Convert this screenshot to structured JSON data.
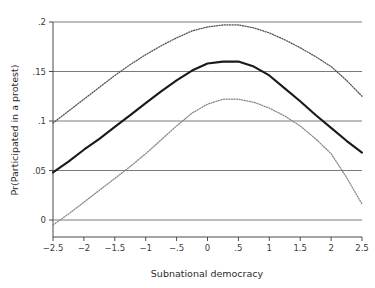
{
  "chart_data": {
    "type": "line",
    "title": "",
    "xlabel": "Subnational democracy",
    "ylabel": "Pr(Participated in a protest)",
    "xlim": [
      -2.5,
      2.5
    ],
    "ylim": [
      0,
      0.2
    ],
    "grid": "horizontal",
    "legend": "none",
    "xticks": [
      "-2.5",
      "-2",
      "-1.5",
      "-1",
      "-.5",
      "0",
      ".5",
      "1",
      "1.5",
      "2",
      "2.5"
    ],
    "xtick_values": [
      -2.5,
      -2,
      -1.5,
      -1,
      -0.5,
      0,
      0.5,
      1,
      1.5,
      2,
      2.5
    ],
    "yticks": [
      "0",
      ".05",
      ".1",
      ".15",
      ".2"
    ],
    "ytick_values": [
      0,
      0.05,
      0.1,
      0.15,
      0.2
    ],
    "x": [
      -2.5,
      -2.25,
      -2,
      -1.75,
      -1.5,
      -1.25,
      -1,
      -0.75,
      -0.5,
      -0.25,
      0,
      0.25,
      0.5,
      0.75,
      1,
      1.25,
      1.5,
      1.75,
      2,
      2.25,
      2.5
    ],
    "series": [
      {
        "name": "Predicted probability",
        "style": "solid",
        "color": "#1a1a1a",
        "values": [
          0.048,
          0.059,
          0.071,
          0.082,
          0.094,
          0.106,
          0.118,
          0.13,
          0.141,
          0.151,
          0.158,
          0.16,
          0.16,
          0.155,
          0.146,
          0.133,
          0.12,
          0.106,
          0.093,
          0.08,
          0.068
        ]
      },
      {
        "name": "Upper 95% confidence bound",
        "style": "dotted",
        "color": "#555555",
        "values": [
          0.098,
          0.11,
          0.122,
          0.134,
          0.146,
          0.157,
          0.167,
          0.176,
          0.184,
          0.191,
          0.195,
          0.197,
          0.197,
          0.194,
          0.189,
          0.182,
          0.174,
          0.165,
          0.155,
          0.141,
          0.125
        ]
      },
      {
        "name": "Lower 95% confidence bound",
        "style": "dotted",
        "color": "#888888",
        "values": [
          -0.005,
          0.006,
          0.018,
          0.03,
          0.042,
          0.054,
          0.067,
          0.081,
          0.095,
          0.108,
          0.117,
          0.122,
          0.122,
          0.119,
          0.113,
          0.105,
          0.095,
          0.082,
          0.067,
          0.043,
          0.016
        ]
      }
    ]
  },
  "axes": {
    "x_title": "Subnational democracy",
    "y_title": "Pr(Participated in a protest)"
  },
  "colors": {
    "grid": "#7a7a7a",
    "axis": "#4a4a4a",
    "estimate": "#1a1a1a",
    "ci_upper": "#555555",
    "ci_lower": "#888888",
    "background": "#ffffff"
  }
}
